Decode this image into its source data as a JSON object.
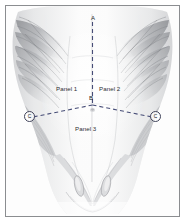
{
  "figure": {
    "view": "anterior",
    "background_color": "#fdfdfd",
    "border_color": "#8b8d90"
  },
  "overlay": {
    "line_color": "#3c4druntime",
    "dash_color": "#474d77",
    "dash_pattern": "4 3",
    "line_width": 1.1
  },
  "panels": [
    {
      "id": "panel-1",
      "label": "Panel 1",
      "position": "upper-left"
    },
    {
      "id": "panel-2",
      "label": "Panel 2",
      "position": "upper-right"
    },
    {
      "id": "panel-3",
      "label": "Panel 3",
      "position": "lower-center"
    }
  ],
  "vertices": [
    {
      "id": "vertex-a",
      "label": "A",
      "circled": false,
      "position": "superior-midline"
    },
    {
      "id": "vertex-b",
      "label": "B",
      "circled": false,
      "position": "umbilicus"
    },
    {
      "id": "vertex-c-left",
      "label": "C",
      "circled": true,
      "position": "left-flank"
    },
    {
      "id": "vertex-c-right",
      "label": "C",
      "circled": true,
      "position": "right-flank"
    }
  ]
}
